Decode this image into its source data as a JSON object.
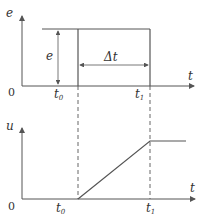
{
  "top_plot": {
    "y_label": "e",
    "x_label": "t",
    "origin": "0",
    "amplitude_label": "e",
    "duration_label": "Δt",
    "t0_label": "t",
    "t0_sub": "0",
    "t1_label": "t",
    "t1_sub": "1"
  },
  "bottom_plot": {
    "y_label": "u",
    "x_label": "t",
    "origin": "0",
    "t0_label": "t",
    "t0_sub": "0",
    "t1_label": "t",
    "t1_sub": "1"
  },
  "colors": {
    "line": "#555555",
    "text": "#333333"
  }
}
